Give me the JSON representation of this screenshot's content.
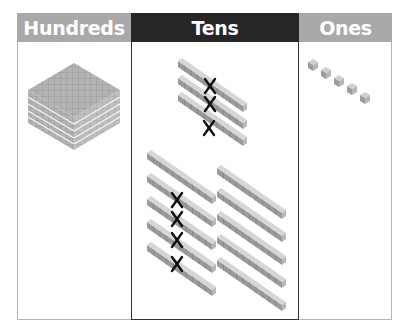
{
  "headers": {
    "hundreds": "Hundreds",
    "tens": "Tens",
    "ones": "Ones"
  },
  "colors": {
    "side_header": "#a9a9a9",
    "tens_header": "#262626",
    "header_text": "#ffffff",
    "cross_mark": "#111111"
  },
  "blocks": {
    "hundreds": {
      "flats": 5,
      "crossed": 0
    },
    "tens": {
      "groups": [
        {
          "rods": 3,
          "crossed": 3
        },
        {
          "rods": 5,
          "crossed": 4
        },
        {
          "rods": 5,
          "crossed": 0
        }
      ]
    },
    "ones": {
      "cubes": 5,
      "crossed": 0
    }
  }
}
